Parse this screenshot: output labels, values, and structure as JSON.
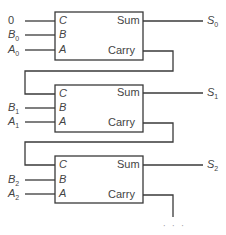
{
  "diagram": {
    "type": "ripple-carry-adder",
    "stages": [
      {
        "inputs": {
          "carry_in": "0",
          "b": "B",
          "b_sub": "0",
          "a": "A",
          "a_sub": "0"
        },
        "ports_in": [
          "C",
          "B",
          "A"
        ],
        "ports_out": [
          "Sum",
          "Carry"
        ],
        "output": {
          "s": "S",
          "s_sub": "0"
        }
      },
      {
        "inputs": {
          "b": "B",
          "b_sub": "1",
          "a": "A",
          "a_sub": "1"
        },
        "ports_in": [
          "C",
          "B",
          "A"
        ],
        "ports_out": [
          "Sum",
          "Carry"
        ],
        "output": {
          "s": "S",
          "s_sub": "1"
        }
      },
      {
        "inputs": {
          "b": "B",
          "b_sub": "2",
          "a": "A",
          "a_sub": "2"
        },
        "ports_in": [
          "C",
          "B",
          "A"
        ],
        "ports_out": [
          "Sum",
          "Carry"
        ],
        "output": {
          "s": "S",
          "s_sub": "2"
        }
      }
    ],
    "continuation": "· · ·"
  },
  "colors": {
    "line": "#3a3a3a",
    "text": "#444444"
  }
}
